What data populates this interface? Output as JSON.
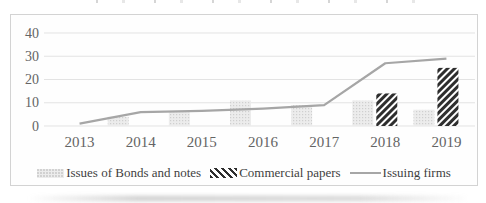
{
  "chart_data": {
    "type": "bar",
    "categories": [
      "2013",
      "2014",
      "2015",
      "2016",
      "2017",
      "2018",
      "2019"
    ],
    "series": [
      {
        "name": "Issues of Bonds and notes",
        "type": "bar",
        "pattern": "light-dotted",
        "values": [
          0,
          4,
          6,
          11,
          9,
          11,
          7
        ]
      },
      {
        "name": "Commercial papers",
        "type": "bar",
        "pattern": "dark-diagonal-hatch",
        "values": [
          0,
          0,
          0,
          0,
          0,
          14,
          25
        ]
      },
      {
        "name": "Issuing firms",
        "type": "line",
        "values": [
          1,
          6,
          6.5,
          7.5,
          9,
          27,
          29
        ]
      }
    ],
    "ylim": [
      0,
      40
    ],
    "yticks": [
      0,
      10,
      20,
      30,
      40
    ],
    "grid": true,
    "legend_position": "bottom"
  },
  "colors": {
    "line": "#a6a6a6",
    "hatch_dark": "#2e2e2e",
    "bar_light_bg": "#ececec",
    "bar_light_dot": "#cfcfcf",
    "grid": "#e3e3e3",
    "axis_text": "#646464",
    "border": "#d3d3d3"
  }
}
